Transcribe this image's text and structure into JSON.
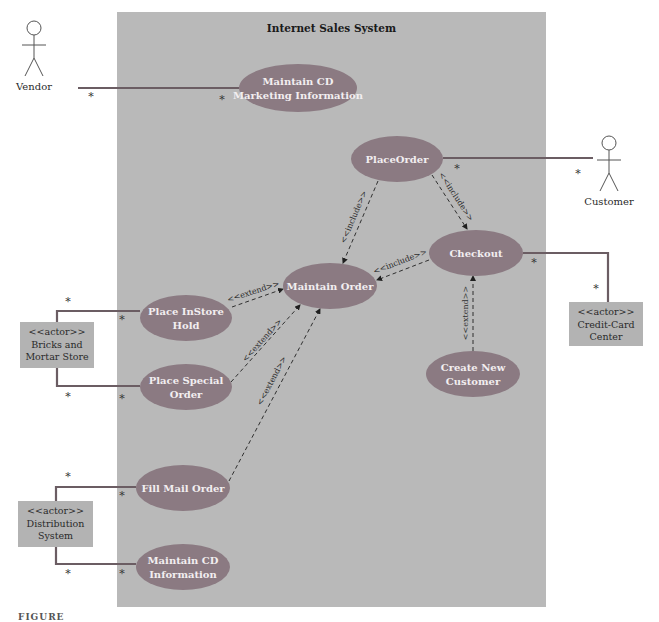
{
  "system": {
    "title": "Internet Sales System",
    "box": {
      "x": 117,
      "y": 12,
      "w": 429,
      "h": 595
    },
    "fill": "#b9b9b9"
  },
  "colors": {
    "usecase_fill": "#8b7a82",
    "usecase_text": "#f2eef0",
    "association_line": "#6b5d63",
    "dashed_line": "#2f2f2f",
    "actor_box_fill": "#b3b3b3",
    "actor_stroke": "#555555"
  },
  "stick_actors": [
    {
      "id": "vendor",
      "label": "Vendor",
      "x": 34,
      "y": 20
    },
    {
      "id": "customer",
      "label": "Customer",
      "x": 609,
      "y": 135
    }
  ],
  "box_actors": [
    {
      "id": "bricks",
      "stereotype": "<<actor>>",
      "lines": [
        "Bricks and",
        "Mortar Store"
      ],
      "x": 20,
      "y": 322,
      "w": 74,
      "h": 46
    },
    {
      "id": "distribution",
      "stereotype": "<<actor>>",
      "lines": [
        "Distribution",
        "System"
      ],
      "x": 18,
      "y": 501,
      "w": 75,
      "h": 46
    },
    {
      "id": "creditcard",
      "stereotype": "<<actor>>",
      "lines": [
        "Credit-Card",
        "Center"
      ],
      "x": 569,
      "y": 302,
      "w": 74,
      "h": 44
    }
  ],
  "use_cases": [
    {
      "id": "maintain-cd-marketing",
      "lines": [
        "Maintain CD",
        "Marketing Information"
      ],
      "cx": 298,
      "cy": 88,
      "rx": 59,
      "ry": 24
    },
    {
      "id": "place-order",
      "lines": [
        "PlaceOrder"
      ],
      "cx": 397,
      "cy": 159,
      "rx": 46,
      "ry": 23
    },
    {
      "id": "checkout",
      "lines": [
        "Checkout"
      ],
      "cx": 476,
      "cy": 253,
      "rx": 47,
      "ry": 23
    },
    {
      "id": "maintain-order",
      "lines": [
        "Maintain Order"
      ],
      "cx": 330,
      "cy": 286,
      "rx": 47,
      "ry": 23
    },
    {
      "id": "place-instore-hold",
      "lines": [
        "Place InStore",
        "Hold"
      ],
      "cx": 186,
      "cy": 318,
      "rx": 46,
      "ry": 23
    },
    {
      "id": "place-special-order",
      "lines": [
        "Place Special",
        "Order"
      ],
      "cx": 186,
      "cy": 387,
      "rx": 46,
      "ry": 23
    },
    {
      "id": "create-new-customer",
      "lines": [
        "Create New",
        "Customer"
      ],
      "cx": 473,
      "cy": 374,
      "rx": 47,
      "ry": 23
    },
    {
      "id": "fill-mail-order",
      "lines": [
        "Fill Mail Order"
      ],
      "cx": 183,
      "cy": 488,
      "rx": 47,
      "ry": 23
    },
    {
      "id": "maintain-cd-information",
      "lines": [
        "Maintain CD",
        "Information"
      ],
      "cx": 183,
      "cy": 567,
      "rx": 47,
      "ry": 23
    }
  ],
  "associations": [
    {
      "id": "vendor-to-marketing",
      "points": [
        [
          78,
          88
        ],
        [
          239,
          88
        ]
      ],
      "mult": [
        {
          "t": "*",
          "x": 91,
          "y": 100
        },
        {
          "t": "*",
          "x": 222,
          "y": 103
        }
      ]
    },
    {
      "id": "customer-to-placeorder",
      "points": [
        [
          443,
          158
        ],
        [
          593,
          158
        ]
      ],
      "mult": [
        {
          "t": "*",
          "x": 457,
          "y": 172
        },
        {
          "t": "*",
          "x": 578,
          "y": 177
        }
      ]
    },
    {
      "id": "checkout-to-creditcard",
      "points": [
        [
          523,
          253
        ],
        [
          608,
          253
        ],
        [
          608,
          302
        ]
      ],
      "mult": [
        {
          "t": "*",
          "x": 534,
          "y": 266
        },
        {
          "t": "*",
          "x": 596,
          "y": 292
        }
      ]
    },
    {
      "id": "bricks-to-instore",
      "points": [
        [
          57,
          322
        ],
        [
          57,
          311
        ],
        [
          140,
          311
        ]
      ],
      "mult": [
        {
          "t": "*",
          "x": 68,
          "y": 305
        },
        {
          "t": "*",
          "x": 122,
          "y": 323
        }
      ]
    },
    {
      "id": "bricks-to-special",
      "points": [
        [
          57,
          368
        ],
        [
          57,
          386
        ],
        [
          140,
          386
        ]
      ],
      "mult": [
        {
          "t": "*",
          "x": 68,
          "y": 400
        },
        {
          "t": "*",
          "x": 122,
          "y": 402
        }
      ]
    },
    {
      "id": "distribution-to-fillmail",
      "points": [
        [
          56,
          501
        ],
        [
          56,
          487
        ],
        [
          136,
          487
        ]
      ],
      "mult": [
        {
          "t": "*",
          "x": 68,
          "y": 480
        },
        {
          "t": "*",
          "x": 122,
          "y": 499
        }
      ]
    },
    {
      "id": "distribution-to-maintaincd",
      "points": [
        [
          56,
          547
        ],
        [
          56,
          564
        ],
        [
          136,
          564
        ]
      ],
      "mult": [
        {
          "t": "*",
          "x": 68,
          "y": 577
        },
        {
          "t": "*",
          "x": 122,
          "y": 577
        }
      ]
    }
  ],
  "dependencies": [
    {
      "id": "placeorder-include-maintainorder",
      "stereotype": "<<include>>",
      "from": [
        378,
        181
      ],
      "to": [
        343,
        263
      ],
      "lx": 356,
      "ly": 218,
      "angle": -67
    },
    {
      "id": "placeorder-include-checkout",
      "stereotype": "<<include>>",
      "from": [
        432,
        175
      ],
      "to": [
        467,
        229
      ],
      "lx": 454,
      "ly": 198,
      "angle": 57
    },
    {
      "id": "checkout-include-maintainorder",
      "stereotype": "<<include>>",
      "from": [
        429,
        260
      ],
      "to": [
        377,
        280
      ],
      "lx": 401,
      "ly": 264,
      "angle": -21
    },
    {
      "id": "instore-extend-maintainorder",
      "stereotype": "<<extend>>",
      "from": [
        232,
        307
      ],
      "to": [
        283,
        289
      ],
      "lx": 254,
      "ly": 294,
      "angle": -18
    },
    {
      "id": "special-extend-maintainorder",
      "stereotype": "<<extend>>",
      "from": [
        231,
        382
      ],
      "to": [
        300,
        305
      ],
      "lx": 264,
      "ly": 342,
      "angle": -48
    },
    {
      "id": "fillmail-extend-maintainorder",
      "stereotype": "<<extend>>",
      "from": [
        229,
        481
      ],
      "to": [
        320,
        309
      ],
      "lx": 274,
      "ly": 382,
      "angle": -62
    },
    {
      "id": "newcustomer-extend-checkout",
      "stereotype": "<<extend>>",
      "from": [
        473,
        351
      ],
      "to": [
        473,
        276
      ],
      "lx": 468,
      "ly": 313,
      "angle": -90
    }
  ],
  "caption": {
    "text": "FIGURE",
    "x": 18,
    "y": 620
  }
}
